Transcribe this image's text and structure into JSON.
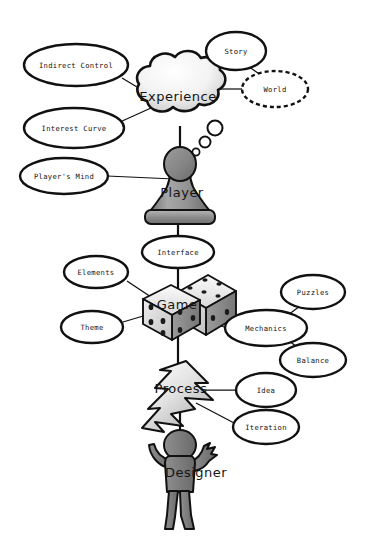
{
  "diagram": {
    "background_color": "#ffffff",
    "line_color": "#111111",
    "fill_light": "#f2f2f2",
    "fill_gray": "#8d8d8d",
    "nodes": [
      {
        "id": "experience",
        "label": "Experience",
        "shape": "thought-cloud",
        "cx": 178,
        "cy": 97
      },
      {
        "id": "player",
        "label": "Player",
        "shape": "chess-pawn",
        "cx": 180,
        "cy": 192
      },
      {
        "id": "game",
        "label": "Game",
        "shape": "dice-pair",
        "cx": 177,
        "cy": 310
      },
      {
        "id": "process",
        "label": "Process",
        "shape": "cycle-arrow",
        "cx": 181,
        "cy": 390
      },
      {
        "id": "designer",
        "label": "Designer",
        "shape": "person",
        "cx": 186,
        "cy": 473
      }
    ],
    "satellites": [
      {
        "id": "indirect-control",
        "label": "Indirect Control",
        "cx": 76,
        "cy": 65,
        "rx": 52,
        "ry": 21,
        "dashed": false
      },
      {
        "id": "story",
        "label": "Story",
        "cx": 236,
        "cy": 51,
        "rx": 30,
        "ry": 19,
        "dashed": false
      },
      {
        "id": "world",
        "label": "World",
        "cx": 275,
        "cy": 89,
        "rx": 33,
        "ry": 18,
        "dashed": true
      },
      {
        "id": "interest-curve",
        "label": "Interest Curve",
        "cx": 74,
        "cy": 128,
        "rx": 50,
        "ry": 20,
        "dashed": false
      },
      {
        "id": "players-mind",
        "label": "Player's Mind",
        "cx": 64,
        "cy": 176,
        "rx": 44,
        "ry": 18,
        "dashed": false
      },
      {
        "id": "interface",
        "label": "Interface",
        "cx": 178,
        "cy": 252,
        "rx": 36,
        "ry": 16,
        "dashed": false
      },
      {
        "id": "elements",
        "label": "Elements",
        "cx": 96,
        "cy": 272,
        "rx": 32,
        "ry": 16,
        "dashed": false
      },
      {
        "id": "theme",
        "label": "Theme",
        "cx": 92,
        "cy": 327,
        "rx": 31,
        "ry": 16,
        "dashed": false
      },
      {
        "id": "puzzles",
        "label": "Puzzles",
        "cx": 313,
        "cy": 292,
        "rx": 32,
        "ry": 17,
        "dashed": false
      },
      {
        "id": "mechanics",
        "label": "Mechanics",
        "cx": 266,
        "cy": 328,
        "rx": 41,
        "ry": 18,
        "dashed": false
      },
      {
        "id": "balance",
        "label": "Balance",
        "cx": 313,
        "cy": 360,
        "rx": 33,
        "ry": 17,
        "dashed": false
      },
      {
        "id": "idea",
        "label": "Idea",
        "cx": 266,
        "cy": 390,
        "rx": 30,
        "ry": 17,
        "dashed": false
      },
      {
        "id": "iteration",
        "label": "Iteration",
        "cx": 266,
        "cy": 427,
        "rx": 33,
        "ry": 17,
        "dashed": false
      }
    ],
    "connections": [
      {
        "from": "indirect-control",
        "to": "experience"
      },
      {
        "from": "story",
        "to": "world"
      },
      {
        "from": "experience",
        "to": "world"
      },
      {
        "from": "interest-curve",
        "to": "experience"
      },
      {
        "from": "players-mind",
        "to": "player"
      },
      {
        "from": "experience",
        "to": "player"
      },
      {
        "from": "player",
        "to": "interface"
      },
      {
        "from": "interface",
        "to": "game"
      },
      {
        "from": "elements",
        "to": "game"
      },
      {
        "from": "theme",
        "to": "game"
      },
      {
        "from": "game",
        "to": "mechanics"
      },
      {
        "from": "mechanics",
        "to": "puzzles"
      },
      {
        "from": "mechanics",
        "to": "balance"
      },
      {
        "from": "game",
        "to": "process"
      },
      {
        "from": "process",
        "to": "idea"
      },
      {
        "from": "process",
        "to": "iteration"
      },
      {
        "from": "process",
        "to": "designer"
      }
    ]
  }
}
